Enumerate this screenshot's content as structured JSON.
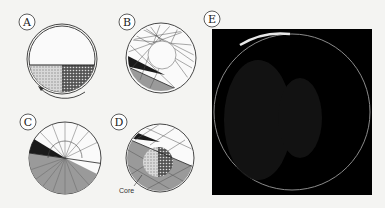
{
  "figure": {
    "panels": [
      {
        "id": "A",
        "label": "A",
        "description": "Rotating drum, half-filled with two granular species (light and dark), rotation arrow"
      },
      {
        "id": "B",
        "label": "B",
        "description": "Drum with chord trajectories, dark wedge and grey flowing layer"
      },
      {
        "id": "C",
        "label": "C",
        "description": "Drum with radial spokes, dark wedge and grey bed"
      },
      {
        "id": "D",
        "label": "D",
        "description": "Drum with segregated core in grey bed",
        "annotations": [
          "Core"
        ]
      },
      {
        "id": "E",
        "label": "E",
        "description": "Photograph of segregated drum on black background"
      }
    ],
    "annotations": {
      "core_label": "Core"
    },
    "colors": {
      "background": "#f4f4f2",
      "ink": "#222222",
      "grey_fill": "#9a9a9a",
      "dark_wedge": "#1a1a1a",
      "photo_bg": "#000000"
    }
  }
}
